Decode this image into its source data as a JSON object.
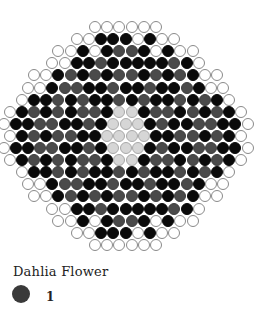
{
  "title": "Dahlia Flower",
  "legend": [
    {
      "color": "#3a3a3a",
      "label": "1"
    }
  ],
  "colors": {
    "W": "#ffffff",
    "B": "#0a0a0a",
    "G": "#4a4a4a",
    "L": "#d6d6d6"
  },
  "pattern": {
    "center_x": 125.5,
    "top_y": 27,
    "spacing_x": 12.2,
    "spacing_y": 12.1,
    "rows": [
      "WWWWWW",
      "WWBBBWBWW",
      "WWBWBGGBWBWW",
      "WWBBGBBBBBGBW",
      "WWBGBGBGGBGBGBWW",
      "WWBGGBBGBBGBBGBWW",
      "WBBGBGBBGBGBBGBGBW",
      "WBGBGBGGBLLBGGBGBGBW",
      "WBBGGBBGBLLLBGBBGGBBW",
      "WBGBGGBBLLLLBBGGBGBW",
      "WBBGGBBGBLLLBGBBGGBBW",
      "WBGBGBGGBLLBGGBGBGBW",
      "WBBGBGBBGBGBBGBGBW",
      "WWBGGBBGBBGBBGBWW",
      "WWBGBGBGGBGBGBWW",
      "WWBBGBBBBBGBW",
      "WWBWBGGBWBWW",
      "WWBBBWBWW",
      "WWWWWW"
    ]
  }
}
